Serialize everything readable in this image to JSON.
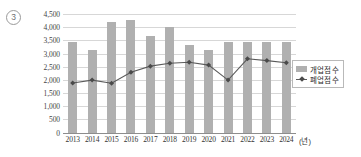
{
  "item_marker": "3",
  "legend": {
    "position": "right-middle",
    "entries": [
      {
        "label": "개업점 수",
        "marker": "bar-swatch",
        "color": "#b0b0b0"
      },
      {
        "label": "폐업점 수",
        "marker": "line-marker",
        "color": "#5a5a5a"
      }
    ]
  },
  "axis": {
    "x_unit_label": "(년)",
    "y_ticks": [
      "0",
      "500",
      "1,000",
      "1,500",
      "2,000",
      "2,500",
      "3,000",
      "3,500",
      "4,000",
      "4,500"
    ]
  },
  "chart_data": {
    "type": "bar",
    "title": "",
    "subtitle": "",
    "xlabel": "(년)",
    "ylabel": "",
    "grid": true,
    "legend_position": "right",
    "ylim": [
      0,
      4500
    ],
    "ytick_step": 500,
    "categories": [
      "2013",
      "2014",
      "2015",
      "2016",
      "2017",
      "2018",
      "2019",
      "2020",
      "2021",
      "2022",
      "2023",
      "2024"
    ],
    "series": [
      {
        "name": "개업점 수",
        "type": "bar",
        "color": "#b0b0b0",
        "values": [
          3430,
          3130,
          4190,
          4260,
          3650,
          3990,
          3310,
          3120,
          3430,
          3430,
          3430,
          3430
        ]
      },
      {
        "name": "폐업점 수",
        "type": "line",
        "color": "#5a5a5a",
        "values": [
          1880,
          1990,
          1870,
          2290,
          2520,
          2630,
          2670,
          2560,
          1990,
          2800,
          2730,
          2650
        ]
      }
    ]
  }
}
